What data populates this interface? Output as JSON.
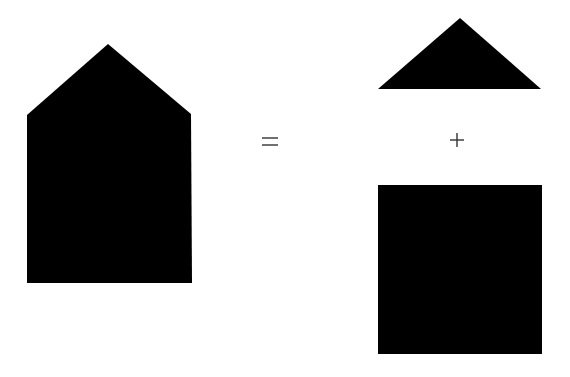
{
  "diagram": {
    "title": "",
    "background_color": "#ffffff",
    "fill_color": "#000000",
    "operator_color": "#333333",
    "shapes": {
      "composite_house": {
        "type": "pentagon",
        "points": [
          [
            108,
            44
          ],
          [
            191,
            114
          ],
          [
            192,
            283
          ],
          [
            27,
            283
          ],
          [
            27,
            115
          ]
        ]
      },
      "triangle": {
        "type": "triangle",
        "points": [
          [
            460,
            18
          ],
          [
            541,
            89
          ],
          [
            378,
            89
          ]
        ]
      },
      "square": {
        "type": "rectangle",
        "x": 378,
        "y": 185,
        "width": 164,
        "height": 169
      }
    },
    "operators": {
      "equals": {
        "symbol": "=",
        "x": 255,
        "y": 131
      },
      "plus": {
        "symbol": "+",
        "x": 442,
        "y": 130
      }
    }
  }
}
